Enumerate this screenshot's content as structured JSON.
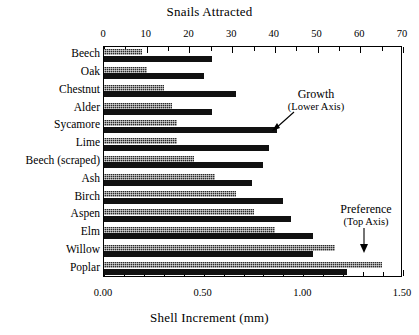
{
  "chart_data": {
    "type": "bar",
    "orientation": "horizontal",
    "title": "",
    "top_axis": {
      "label": "Snails Attracted",
      "min": 0,
      "max": 70,
      "ticks": [
        0,
        10,
        20,
        30,
        40,
        50,
        60,
        70
      ],
      "tick_labels": [
        "0",
        "10",
        "20",
        "30",
        "40",
        "50",
        "60",
        "70"
      ],
      "minor_tick_step": 5
    },
    "bottom_axis": {
      "label": "Shell Increment (mm)",
      "min": 0.0,
      "max": 1.5,
      "ticks": [
        0.0,
        0.5,
        1.0,
        1.5
      ],
      "tick_labels": [
        "0.00",
        "0.50",
        "1.00",
        "1.50"
      ],
      "minor_tick_step": 0.1
    },
    "categories": [
      "Beech",
      "Oak",
      "Chestnut",
      "Alder",
      "Sycamore",
      "Lime",
      "Beech (scraped)",
      "Ash",
      "Birch",
      "Aspen",
      "Elm",
      "Willow",
      "Poplar"
    ],
    "series": [
      {
        "name": "Preference (Top Axis)",
        "axis": "top",
        "style": "hatched",
        "units": "snails attracted",
        "values": [
          9,
          10,
          14,
          16,
          17,
          17,
          21,
          26,
          31,
          35,
          40,
          54,
          65
        ]
      },
      {
        "name": "Growth (Lower Axis)",
        "axis": "bottom",
        "style": "solid",
        "units": "mm shell increment",
        "values": [
          0.54,
          0.5,
          0.66,
          0.54,
          0.87,
          0.83,
          0.8,
          0.74,
          0.9,
          0.94,
          1.05,
          1.05,
          1.22
        ]
      }
    ],
    "annotations": [
      {
        "id": "growth",
        "line1": "Growth",
        "line2": "(Lower Axis)"
      },
      {
        "id": "preference",
        "line1": "Preference",
        "line2": "(Top Axis)"
      }
    ],
    "grid": false,
    "legend": "inline-annotations",
    "colors": {
      "preference_bar": "#2b2b2b",
      "growth_bar": "#111111",
      "axis": "#000000",
      "background": "#ffffff"
    }
  }
}
